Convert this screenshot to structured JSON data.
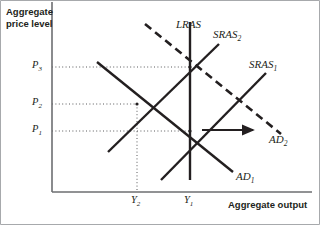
{
  "figure": {
    "type": "economics-diagram",
    "topic": "aggregate-demand-aggregate-supply"
  },
  "axes": {
    "y_title_line1": "Aggregate",
    "y_title_line2": "price level",
    "x_title": "Aggregate output",
    "origin": {
      "x": 52,
      "y": 192
    },
    "x_end": 312,
    "y_top": 2
  },
  "ticks": {
    "y": [
      {
        "name": "P3",
        "base": "P",
        "sub": "3",
        "py": 67
      },
      {
        "name": "P2",
        "base": "P",
        "sub": "2",
        "py": 104
      },
      {
        "name": "P1",
        "base": "P",
        "sub": "1",
        "py": 131
      }
    ],
    "x": [
      {
        "name": "Y2",
        "base": "Y",
        "sub": "2",
        "px": 137
      },
      {
        "name": "Y1",
        "base": "Y",
        "sub": "1",
        "px": 190
      }
    ]
  },
  "curves": [
    {
      "id": "LRAS",
      "base": "LRAS",
      "sub": "",
      "style": "solid",
      "kind": "vertical",
      "x1": 190,
      "y1": 22,
      "x2": 190,
      "y2": 180,
      "label_x": 176,
      "label_y": 18
    },
    {
      "id": "SRAS2",
      "base": "SRAS",
      "sub": "2",
      "style": "solid",
      "kind": "upward",
      "x1": 108,
      "y1": 152,
      "x2": 219,
      "y2": 44,
      "label_x": 213,
      "label_y": 28
    },
    {
      "id": "SRAS1",
      "base": "SRAS",
      "sub": "1",
      "style": "solid",
      "kind": "upward",
      "x1": 161,
      "y1": 180,
      "x2": 266,
      "y2": 73,
      "label_x": 249,
      "label_y": 58
    },
    {
      "id": "AD1",
      "base": "AD",
      "sub": "1",
      "style": "solid",
      "kind": "downward",
      "x1": 97,
      "y1": 62,
      "x2": 233,
      "y2": 172,
      "label_x": 236,
      "label_y": 170
    },
    {
      "id": "AD2",
      "base": "AD",
      "sub": "2",
      "style": "dashed",
      "kind": "downward",
      "x1": 145,
      "y1": 24,
      "x2": 281,
      "y2": 134,
      "label_x": 269,
      "label_y": 133
    }
  ],
  "equilibria": [
    {
      "name": "eq-initial",
      "px": 190,
      "py": 131
    },
    {
      "name": "eq-short-run",
      "px": 137,
      "py": 104
    },
    {
      "name": "eq-long-run",
      "px": 190,
      "py": 67
    }
  ],
  "guides": [
    {
      "name": "guide-P3",
      "orient": "horizontal",
      "x1": 52,
      "y1": 67,
      "x2": 190,
      "y2": 67
    },
    {
      "name": "guide-P2",
      "orient": "horizontal",
      "x1": 52,
      "y1": 104,
      "x2": 137,
      "y2": 104
    },
    {
      "name": "guide-P1",
      "orient": "horizontal",
      "x1": 52,
      "y1": 131,
      "x2": 190,
      "y2": 131
    },
    {
      "name": "guide-Y2",
      "orient": "vertical",
      "x1": 137,
      "y1": 104,
      "x2": 137,
      "y2": 192
    }
  ],
  "shift_arrow": {
    "name": "ad-shift-arrow",
    "direction": "right",
    "x1": 202,
    "y1": 130,
    "x2": 253,
    "y2": 130
  },
  "colors": {
    "ink": "#231f20",
    "axis": "#6d6e71",
    "guide": "#58595b",
    "frame": "#a7a9ac"
  }
}
